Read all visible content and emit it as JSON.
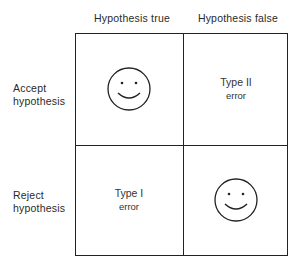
{
  "columns": [
    {
      "label": "Hypothesis true"
    },
    {
      "label": "Hypothesis false"
    }
  ],
  "rows": [
    {
      "label_line1": "Accept",
      "label_line2": "hypothesis"
    },
    {
      "label_line1": "Reject",
      "label_line2": "hypothesis"
    }
  ],
  "cells": {
    "accept_true": {
      "icon": "smiley-face-icon"
    },
    "accept_false": {
      "line1": "Type II",
      "line2": "error"
    },
    "reject_true": {
      "line1": "Type I",
      "line2": "error"
    },
    "reject_false": {
      "icon": "smiley-face-icon"
    }
  }
}
